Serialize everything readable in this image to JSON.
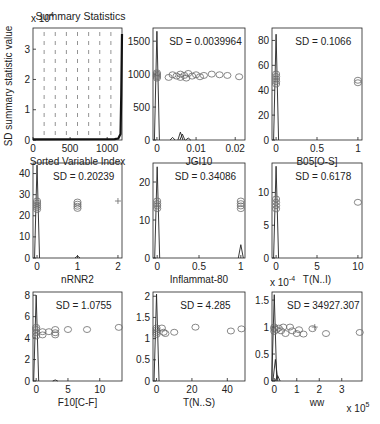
{
  "figure": {
    "width": 380,
    "height": 424,
    "background": "#ffffff"
  },
  "chart_data": [
    {
      "id": "summary",
      "type": "line",
      "title": "Summary Statistics",
      "xlabel": "Sorted Variable Index",
      "ylabel": "SD summary statistic value",
      "y_exponent": "x 10^4",
      "xlim": [
        0,
        1200
      ],
      "ylim": [
        0,
        3.7
      ],
      "xticks": [
        0,
        500,
        1000
      ],
      "yticks": [
        0,
        1,
        2,
        3
      ],
      "box": [
        33,
        28,
        122,
        140
      ],
      "grid": "vertical dashed",
      "series": [
        {
          "name": "sorted SD",
          "x": [
            0,
            1100,
            1150,
            1180,
            1190,
            1200
          ],
          "y": [
            0.02,
            0.03,
            0.05,
            0.2,
            1.5,
            3.5
          ]
        }
      ]
    },
    {
      "id": "JGI10",
      "type": "scatter",
      "xlabel": "JGI10",
      "annotation": "SD = 0.0039964",
      "xlim": [
        -0.001,
        0.0225
      ],
      "ylim": [
        0,
        1700
      ],
      "xticks": [
        0,
        0.01,
        0.02
      ],
      "xtick_labels": [
        "0",
        "0.01",
        "0.02"
      ],
      "yticks": [
        0,
        500,
        1000,
        1500
      ],
      "box": [
        153,
        28,
        245,
        140
      ],
      "points": [
        [
          0,
          960
        ],
        [
          0,
          1000
        ],
        [
          0,
          940
        ],
        [
          0,
          1020
        ],
        [
          0,
          980
        ],
        [
          0.003,
          950
        ],
        [
          0.004,
          990
        ],
        [
          0.005,
          970
        ],
        [
          0.006,
          1000
        ],
        [
          0.006,
          950
        ],
        [
          0.007,
          980
        ],
        [
          0.0075,
          940
        ],
        [
          0.008,
          1010
        ],
        [
          0.009,
          970
        ],
        [
          0.01,
          990
        ],
        [
          0.011,
          960
        ],
        [
          0.012,
          980
        ],
        [
          0.014,
          1000
        ],
        [
          0.016,
          990
        ],
        [
          0.018,
          980
        ],
        [
          0.021,
          960
        ]
      ],
      "spikes": [
        [
          0,
          1650
        ],
        [
          0.006,
          120
        ],
        [
          0.0065,
          90
        ],
        [
          0.004,
          40
        ],
        [
          0.008,
          30
        ]
      ]
    },
    {
      "id": "B05[O-S]",
      "type": "scatter",
      "xlabel": "B05[O-S]",
      "annotation": "SD = 0.1066",
      "xlim": [
        -0.05,
        1.05
      ],
      "ylim": [
        0,
        90
      ],
      "xticks": [
        0,
        0.5,
        1
      ],
      "xtick_labels": [
        "0",
        "0.5",
        "1"
      ],
      "yticks": [
        0,
        20,
        40,
        60,
        80
      ],
      "box": [
        272,
        28,
        362,
        140
      ],
      "points": [
        [
          0,
          45
        ],
        [
          0,
          47
        ],
        [
          0,
          49
        ],
        [
          0,
          51
        ],
        [
          0,
          53
        ],
        [
          1,
          46
        ],
        [
          1,
          48
        ]
      ],
      "spikes": [
        [
          0,
          85
        ]
      ]
    },
    {
      "id": "nRNR2",
      "type": "scatter",
      "xlabel": "nRNR2",
      "annotation": "SD = 0.20239",
      "xlim": [
        -0.1,
        2.1
      ],
      "ylim": [
        0,
        45
      ],
      "xticks": [
        0,
        1,
        2
      ],
      "xtick_labels": [
        "0",
        "1",
        "2"
      ],
      "yticks": [
        0,
        10,
        20,
        30,
        40
      ],
      "box": [
        33,
        163,
        122,
        258
      ],
      "points": [
        [
          0,
          23
        ],
        [
          0,
          24
        ],
        [
          0,
          25
        ],
        [
          0,
          26
        ],
        [
          0,
          27
        ],
        [
          1,
          23.5
        ],
        [
          1,
          24.5
        ],
        [
          1,
          25.5
        ],
        [
          1,
          26.5
        ]
      ],
      "plus": [
        [
          2,
          27
        ]
      ],
      "spikes": [
        [
          0,
          44
        ],
        [
          1,
          1
        ]
      ]
    },
    {
      "id": "Inflammat-80",
      "type": "scatter",
      "xlabel": "Inflammat-80",
      "annotation": "SD = 0.34086",
      "xlim": [
        -0.05,
        1.05
      ],
      "ylim": [
        0,
        25
      ],
      "xticks": [
        0,
        0.5,
        1
      ],
      "xtick_labels": [
        "0",
        "0.5",
        "1"
      ],
      "yticks": [
        0,
        10,
        20
      ],
      "box": [
        153,
        163,
        245,
        258
      ],
      "points": [
        [
          0,
          13
        ],
        [
          0,
          13.7
        ],
        [
          0,
          14.3
        ],
        [
          0,
          15
        ],
        [
          1,
          13
        ],
        [
          1,
          13.7
        ],
        [
          1,
          14.3
        ],
        [
          1,
          15
        ]
      ],
      "spikes": [
        [
          0,
          24
        ],
        [
          1,
          3.5
        ]
      ]
    },
    {
      "id": "T(N..I)",
      "type": "scatter",
      "xlabel": "T(N..I)",
      "annotation": "SD = 0.6178",
      "xlim": [
        -0.5,
        10.5
      ],
      "ylim": [
        0,
        14.5
      ],
      "xticks": [
        0,
        5,
        10
      ],
      "xtick_labels": [
        "0",
        "5",
        "10"
      ],
      "yticks": [
        0,
        5,
        10
      ],
      "box": [
        272,
        163,
        362,
        258
      ],
      "points": [
        [
          0,
          7.5
        ],
        [
          0,
          8
        ],
        [
          0,
          8.5
        ],
        [
          0,
          9
        ],
        [
          10,
          8.5
        ]
      ],
      "spikes": [
        [
          0,
          14
        ]
      ]
    },
    {
      "id": "F10[C-F]",
      "type": "scatter",
      "xlabel": "F10[C-F]",
      "annotation": "SD = 1.0755",
      "xlim": [
        -0.5,
        13.5
      ],
      "ylim": [
        0,
        8.3
      ],
      "xticks": [
        0,
        5,
        10
      ],
      "xtick_labels": [
        "0",
        "5",
        "10"
      ],
      "yticks": [
        0,
        2,
        4,
        6,
        8
      ],
      "box": [
        33,
        292,
        122,
        381
      ],
      "points": [
        [
          0,
          4.2
        ],
        [
          0,
          4.5
        ],
        [
          0,
          4.8
        ],
        [
          0,
          5
        ],
        [
          1,
          4.3
        ],
        [
          1,
          4.6
        ],
        [
          2,
          4.6
        ],
        [
          3,
          4.3
        ],
        [
          3,
          4.5
        ],
        [
          3,
          4.8
        ],
        [
          5,
          4.8
        ],
        [
          8,
          4.8
        ],
        [
          13,
          5
        ]
      ],
      "spikes": [
        [
          0,
          8
        ],
        [
          3,
          0.1
        ]
      ]
    },
    {
      "id": "T(N..S)",
      "type": "scatter",
      "xlabel": "T(N..S)",
      "annotation": "SD = 4.285",
      "xlim": [
        -2,
        50
      ],
      "ylim": [
        0,
        2.1
      ],
      "xticks": [
        0,
        20,
        40
      ],
      "xtick_labels": [
        "0",
        "20",
        "40"
      ],
      "yticks": [
        0,
        0.5,
        1,
        1.5,
        2
      ],
      "box": [
        153,
        292,
        245,
        381
      ],
      "points": [
        [
          0,
          1.1
        ],
        [
          0,
          1.15
        ],
        [
          0,
          1.2
        ],
        [
          0,
          1.25
        ],
        [
          3,
          1.25
        ],
        [
          4,
          1.15
        ],
        [
          5,
          1.12
        ],
        [
          10,
          1.15
        ],
        [
          22,
          1.27
        ],
        [
          42,
          1.18
        ],
        [
          48,
          1.23
        ]
      ],
      "spikes": [
        [
          0,
          2.05
        ]
      ]
    },
    {
      "id": "ww",
      "type": "scatter",
      "xlabel": "ww",
      "annotation": "SD = 34927.307",
      "y_exponent": "x 10^-4",
      "x_exponent": "x 10^5",
      "xlim": [
        -0.1,
        3.9
      ],
      "ylim": [
        0,
        1.65
      ],
      "xticks": [
        0,
        1,
        2,
        3
      ],
      "xtick_labels": [
        "0",
        "1",
        "2",
        "3"
      ],
      "yticks": [
        0,
        0.5,
        1,
        1.5
      ],
      "ytick_labels": [
        "0",
        "0.5",
        "1",
        "1.5"
      ],
      "box": [
        272,
        292,
        362,
        381
      ],
      "points": [
        [
          0,
          0.92
        ],
        [
          0,
          0.97
        ],
        [
          0,
          1.0
        ],
        [
          0.1,
          0.95
        ],
        [
          0.2,
          0.98
        ],
        [
          0.3,
          0.93
        ],
        [
          0.4,
          1.0
        ],
        [
          0.5,
          0.88
        ],
        [
          0.7,
          1.0
        ],
        [
          0.8,
          0.93
        ],
        [
          1,
          0.88
        ],
        [
          1.1,
          0.95
        ],
        [
          1.3,
          0.87
        ],
        [
          1.7,
          0.97
        ],
        [
          2.3,
          0.88
        ],
        [
          3.8,
          0.9
        ]
      ],
      "plus": [
        [
          1.8,
          1.0
        ]
      ],
      "spikes": [
        [
          0,
          1.6
        ],
        [
          0.05,
          0.4
        ],
        [
          0.15,
          0.1
        ]
      ]
    }
  ],
  "styles": {
    "marker_color": "#6a6a6a",
    "line_color": "#222222",
    "axis_color": "#222222",
    "grid_color": "#777777"
  }
}
